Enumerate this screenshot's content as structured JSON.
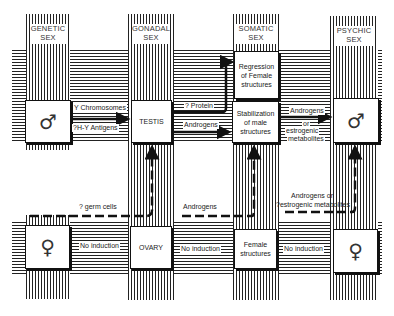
{
  "columns": [
    {
      "id": "genetic",
      "header_line1": "GENETIC",
      "header_line2": "SEX"
    },
    {
      "id": "gonadal",
      "header_line1": "GONADAL",
      "header_line2": "SEX"
    },
    {
      "id": "somatic",
      "header_line1": "SOMATIC",
      "header_line2": "SEX"
    },
    {
      "id": "psychic",
      "header_line1": "PSYCHIC",
      "header_line2": "SEX"
    }
  ],
  "male_row": {
    "genetic_symbol": "♂",
    "gonad": "TESTIS",
    "regression_line1": "Regression",
    "regression_line2": "of Female",
    "regression_line3": "structures",
    "stabilization_line1": "Stabilization",
    "stabilization_line2": "of male",
    "stabilization_line3": "structures",
    "psychic_symbol": "♂",
    "arrow_labels": {
      "y_chromosomes": "Y Chromosomes",
      "hy_antigens": "?H-Y Antigens",
      "protein": "? Protein",
      "androgens": "Androgens",
      "psychic_line1": "Androgens",
      "psychic_line2": "or",
      "psychic_line3": "estrogenic",
      "psychic_line4": "metabolites"
    }
  },
  "female_row": {
    "genetic_symbol": "♀",
    "gonad": "OVARY",
    "somatic_line1": "Female",
    "somatic_line2": "structures",
    "psychic_symbol": "♀",
    "arrow_labels": {
      "no_induction_1": "No induction",
      "no_induction_2": "No induction",
      "no_induction_3": "No induction"
    }
  },
  "dashed_paths": {
    "germ_cells": "? germ cells",
    "androgens": "Androgens",
    "psychic_line1": "Androgens or",
    "psychic_line2": "?estrogenic  metabolites"
  }
}
